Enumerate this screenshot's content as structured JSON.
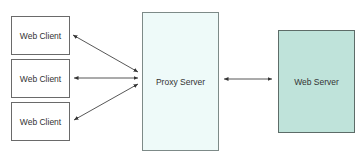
{
  "diagram": {
    "clients": [
      {
        "label": "Web Client"
      },
      {
        "label": "Web Client"
      },
      {
        "label": "Web Client"
      }
    ],
    "proxy": {
      "label": "Proxy Server",
      "fill": "#eefaf9"
    },
    "server": {
      "label": "Web Server",
      "fill": "#bfe3da"
    },
    "edges": [
      {
        "from": "Web Client 1",
        "to": "Proxy Server",
        "direction": "bidirectional"
      },
      {
        "from": "Web Client 2",
        "to": "Proxy Server",
        "direction": "bidirectional"
      },
      {
        "from": "Web Client 3",
        "to": "Proxy Server",
        "direction": "bidirectional"
      },
      {
        "from": "Proxy Server",
        "to": "Web Server",
        "direction": "bidirectional"
      }
    ]
  }
}
